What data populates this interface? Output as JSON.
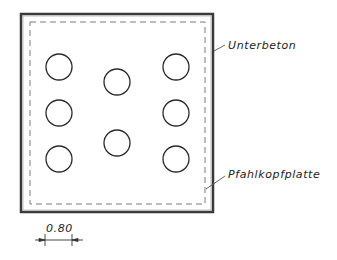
{
  "drawing": {
    "type": "pile cap plan (Pfahlkopfplatte)",
    "colors": {
      "line": "#2a2a2a",
      "outer_border": "#3a3a3a",
      "dashed": "#7a7a7a",
      "background": "#ffffff"
    },
    "outer_slab": {
      "x": 21,
      "y": 14,
      "width": 192,
      "height": 198
    },
    "inner_dashed": {
      "x": 30,
      "y": 22,
      "width": 175,
      "height": 182
    },
    "piles": [
      {
        "id": "pile-1",
        "cx": 59,
        "cy": 67,
        "r": 13
      },
      {
        "id": "pile-2",
        "cx": 59,
        "cy": 113,
        "r": 13
      },
      {
        "id": "pile-3",
        "cx": 59,
        "cy": 159,
        "r": 13
      },
      {
        "id": "pile-4",
        "cx": 117,
        "cy": 82,
        "r": 13
      },
      {
        "id": "pile-5",
        "cx": 117,
        "cy": 143,
        "r": 13
      },
      {
        "id": "pile-6",
        "cx": 176,
        "cy": 67,
        "r": 13
      },
      {
        "id": "pile-7",
        "cx": 176,
        "cy": 113,
        "r": 13
      },
      {
        "id": "pile-8",
        "cx": 176,
        "cy": 159,
        "r": 13
      }
    ],
    "labels": {
      "unterbeton": "Unterbeton",
      "pfahlkopfplatte": "Pfahlkopfplatte"
    },
    "dimension": {
      "value": "0.80"
    }
  }
}
